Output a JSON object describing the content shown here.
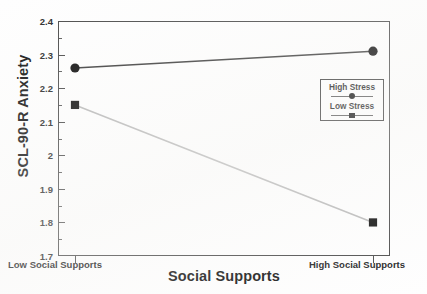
{
  "chart_data": {
    "type": "line",
    "title": "",
    "xlabel": "Social Supports",
    "ylabel": "SCL-90-R Anxiety",
    "categories": [
      "Low Social Supports",
      "High Social Supports"
    ],
    "ylim": [
      1.7,
      2.4
    ],
    "ytick_labels": [
      "2.4",
      "2.3",
      "2.2",
      "2.1",
      "2",
      "1.9",
      "1.8",
      "1.7"
    ],
    "ytick_values": [
      2.4,
      2.3,
      2.2,
      2.1,
      2.0,
      1.9,
      1.8,
      1.7
    ],
    "yminor_values": [
      2.35,
      2.25,
      2.15,
      2.05,
      1.95,
      1.85,
      1.75
    ],
    "grid": false,
    "legend_position": "upper-right-inside",
    "series": [
      {
        "name": "High Stress",
        "marker": "circle",
        "color": "#0d0d0d",
        "line_color": "#3c3c3c",
        "values": [
          2.26,
          2.31
        ]
      },
      {
        "name": "Low Stress",
        "marker": "square",
        "color": "#0d0d0d",
        "line_color": "#b9b9b9",
        "values": [
          2.15,
          1.8
        ]
      }
    ]
  },
  "axes": {
    "y_title": "SCL-90-R Anxiety",
    "x_title": "Social Supports",
    "ytick_0": "2.4",
    "ytick_1": "2.3",
    "ytick_2": "2.2",
    "ytick_3": "2.1",
    "ytick_4": "2",
    "ytick_5": "1.9",
    "ytick_6": "1.8",
    "ytick_7": "1.7",
    "xcat_low": "Low Social Supports",
    "xcat_high": "High Social Supports"
  },
  "legend": {
    "entries": [
      {
        "label": "High Stress",
        "marker": "circle"
      },
      {
        "label": "Low Stress",
        "marker": "square"
      }
    ]
  },
  "colors": {
    "frame": "#4a4a4a",
    "series_high_stress_line": "#3c3c3c",
    "series_low_stress_line": "#b9b9b9",
    "marker_fill": "#0d0d0d",
    "text": "#1a1a1a",
    "background": "#ffffff"
  }
}
